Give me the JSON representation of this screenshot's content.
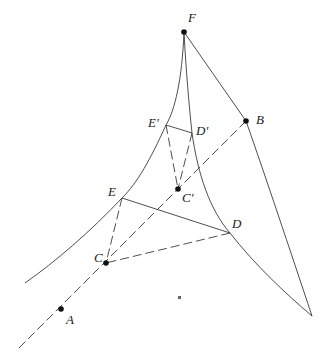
{
  "diagram": {
    "width": 331,
    "height": 363,
    "stroke_color": "#3a3a3a",
    "point_color": "#111111",
    "points": {
      "F": {
        "label": "F",
        "x": 184,
        "y": 32,
        "lx": 188,
        "ly": 22
      },
      "B": {
        "label": "B",
        "x": 246,
        "y": 121,
        "lx": 256,
        "ly": 124
      },
      "E'": {
        "label": "E′",
        "x": 166,
        "y": 125,
        "lx": 148,
        "ly": 127
      },
      "D'": {
        "label": "D′",
        "x": 192,
        "y": 133,
        "lx": 196,
        "ly": 135
      },
      "C'": {
        "label": "C′",
        "x": 178,
        "y": 189,
        "lx": 182,
        "ly": 202
      },
      "E": {
        "label": "E",
        "x": 122,
        "y": 198,
        "lx": 108,
        "ly": 196
      },
      "D": {
        "label": "D",
        "x": 230,
        "y": 233,
        "lx": 232,
        "ly": 228
      },
      "C": {
        "label": "C",
        "x": 106,
        "y": 263,
        "lx": 94,
        "ly": 262
      },
      "A": {
        "label": "A",
        "x": 61,
        "y": 309,
        "lx": 66,
        "ly": 324
      }
    },
    "labels": [
      "F",
      "B",
      "E′",
      "D′",
      "C′",
      "E",
      "D",
      "C",
      "A"
    ],
    "marked_points": [
      "F",
      "B",
      "C'",
      "C",
      "A"
    ],
    "curves": [
      {
        "name": "left-curve",
        "from": "F",
        "to": [
          25,
          283
        ],
        "passes": [
          "E'",
          "E"
        ]
      },
      {
        "name": "inner-curve",
        "from": "F",
        "to": [
          312,
          316
        ],
        "passes": [
          "D'",
          "D"
        ]
      },
      {
        "name": "right-line",
        "from": "F",
        "to": "B",
        "style": "solid"
      },
      {
        "name": "right-curve",
        "from": "B",
        "to": [
          312,
          316
        ],
        "style": "solid"
      }
    ],
    "segments": [
      {
        "from": "E'",
        "to": "D'",
        "style": "solid"
      },
      {
        "from": "E'",
        "to": "C'",
        "style": "dashed"
      },
      {
        "from": "D'",
        "to": "C'",
        "style": "dashed"
      },
      {
        "from": "E",
        "to": "D",
        "style": "solid"
      },
      {
        "from": "E",
        "to": "C",
        "style": "dashed"
      },
      {
        "from": "D",
        "to": "C",
        "style": "dashed"
      },
      {
        "from": "B",
        "to": [
          17,
          350
        ],
        "style": "dashed",
        "passes": [
          "C'",
          "C",
          "A"
        ]
      }
    ]
  }
}
